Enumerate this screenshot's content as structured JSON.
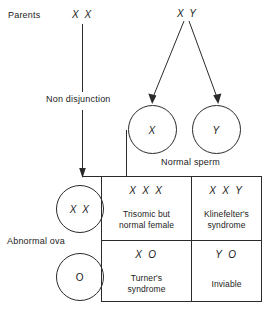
{
  "diagram": {
    "row_labels": {
      "parents": "Parents",
      "non_disjunction": "Non disjunction",
      "abnormal_ova": "Abnormal ova",
      "normal_sperm": "Normal sperm"
    },
    "parents": {
      "mother": "X X",
      "father": "X Y"
    },
    "sperm_gametes": [
      {
        "label": "X"
      },
      {
        "label": "Y"
      }
    ],
    "ova_gametes": [
      {
        "label": "X X",
        "italic": true
      },
      {
        "label": "O",
        "italic": false
      }
    ],
    "punnett": {
      "cells": [
        {
          "genotype": "X X X",
          "description_line1": "Trisomic but",
          "description_line2": "normal female"
        },
        {
          "genotype": "X X Y",
          "description_line1": "Klinefelter's",
          "description_line2": "syndrome"
        },
        {
          "genotype": "X O",
          "description_line1": "Turner's",
          "description_line2": "syndrome"
        },
        {
          "genotype": "Y O",
          "description_line1": "Inviable",
          "description_line2": ""
        }
      ]
    },
    "colors": {
      "ink": "#1b1b1b",
      "line": "#2a2a2a",
      "background": "#ffffff"
    }
  }
}
